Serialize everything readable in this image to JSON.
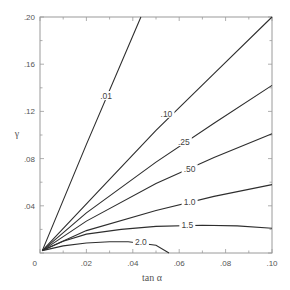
{
  "chart_data": {
    "type": "line",
    "title": "",
    "xlabel": "tan α",
    "ylabel": "γ",
    "xlim": [
      0,
      0.1
    ],
    "ylim": [
      0,
      0.2
    ],
    "grid": false,
    "legend": "none (inline curve labels)",
    "x_ticks": [
      "0",
      ".02",
      ".04",
      ".06",
      ".08",
      ".10"
    ],
    "x_tick_values": [
      0,
      0.02,
      0.04,
      0.06,
      0.08,
      0.1
    ],
    "y_ticks": [
      ".04",
      ".08",
      ".12",
      ".16",
      ".20"
    ],
    "y_tick_values": [
      0.04,
      0.08,
      0.12,
      0.16,
      0.2
    ],
    "series": [
      {
        "name": ".01",
        "label": ".01",
        "label_at": [
          0.0285,
          0.133
        ],
        "points": [
          [
            0.001,
            0.002
          ],
          [
            0.02,
            0.092
          ],
          [
            0.0435,
            0.2
          ]
        ]
      },
      {
        "name": ".10",
        "label": ".10",
        "label_at": [
          0.0545,
          0.118
        ],
        "points": [
          [
            0.001,
            0.002
          ],
          [
            0.025,
            0.052
          ],
          [
            0.05,
            0.104
          ],
          [
            0.075,
            0.152
          ],
          [
            0.1,
            0.2
          ]
        ]
      },
      {
        "name": ".25",
        "label": ".25",
        "label_at": [
          0.062,
          0.094
        ],
        "points": [
          [
            0.001,
            0.002
          ],
          [
            0.02,
            0.034
          ],
          [
            0.05,
            0.077
          ],
          [
            0.075,
            0.11
          ],
          [
            0.1,
            0.142
          ]
        ]
      },
      {
        "name": ".50",
        "label": ".50",
        "label_at": [
          0.0645,
          0.071
        ],
        "points": [
          [
            0.001,
            0.002
          ],
          [
            0.02,
            0.027
          ],
          [
            0.05,
            0.059
          ],
          [
            0.075,
            0.081
          ],
          [
            0.1,
            0.101
          ]
        ]
      },
      {
        "name": "1.0",
        "label": "1.0",
        "label_at": [
          0.0645,
          0.043
        ],
        "points": [
          [
            0.001,
            0.002
          ],
          [
            0.02,
            0.019
          ],
          [
            0.05,
            0.036
          ],
          [
            0.075,
            0.048
          ],
          [
            0.1,
            0.058
          ]
        ]
      },
      {
        "name": "1.5",
        "label": "1.5",
        "label_at": [
          0.0635,
          0.0235
        ],
        "points": [
          [
            0.001,
            0.002
          ],
          [
            0.01,
            0.01
          ],
          [
            0.02,
            0.016
          ],
          [
            0.035,
            0.02
          ],
          [
            0.05,
            0.0225
          ],
          [
            0.07,
            0.0235
          ],
          [
            0.085,
            0.023
          ],
          [
            0.1,
            0.021
          ]
        ]
      },
      {
        "name": "2.0",
        "label": "2.0",
        "label_at": [
          0.0435,
          0.0095
        ],
        "points": [
          [
            0.001,
            0.002
          ],
          [
            0.01,
            0.006
          ],
          [
            0.02,
            0.0085
          ],
          [
            0.03,
            0.0095
          ],
          [
            0.038,
            0.0095
          ],
          [
            0.05,
            0.0065
          ],
          [
            0.0556,
            0.0
          ]
        ]
      }
    ]
  },
  "axes": {
    "xlabel": "tan α",
    "ylabel": "γ",
    "origin_label": "0"
  }
}
